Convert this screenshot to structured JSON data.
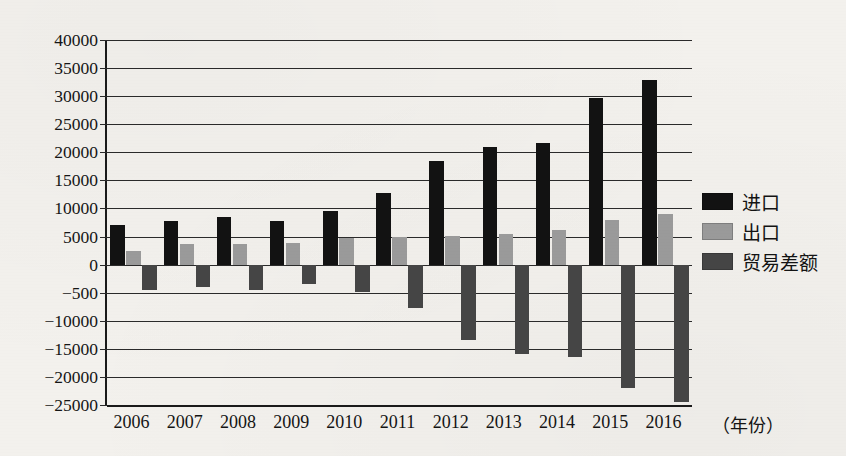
{
  "chart_data": {
    "type": "bar",
    "title": "",
    "xlabel": "（年份）",
    "ylabel": "",
    "grid": true,
    "legend_position": "right",
    "ylim": [
      -25000,
      40000
    ],
    "ytick_labels": [
      "40000",
      "35000",
      "30000",
      "25000",
      "20000",
      "15000",
      "10000",
      "5000",
      "0",
      "-500",
      "-10000",
      "-15000",
      "-20000",
      "-25000"
    ],
    "ytick_values": [
      40000,
      35000,
      30000,
      25000,
      20000,
      15000,
      10000,
      5000,
      0,
      -5000,
      -10000,
      -15000,
      -20000,
      -25000
    ],
    "categories": [
      "2006",
      "2007",
      "2008",
      "2009",
      "2010",
      "2011",
      "2012",
      "2013",
      "2014",
      "2015",
      "2016"
    ],
    "series": [
      {
        "name": "进口",
        "color": "#121212",
        "values": [
          7000,
          7700,
          8400,
          7700,
          9600,
          12800,
          18400,
          20900,
          21700,
          29700,
          32800
        ]
      },
      {
        "name": "出口",
        "color": "#9a9a9a",
        "values": [
          2500,
          3700,
          3600,
          3900,
          4800,
          4900,
          5100,
          5500,
          6200,
          8000,
          9000
        ]
      },
      {
        "name": "贸易差额",
        "color": "#454545",
        "values": [
          -4500,
          -4000,
          -4500,
          -3500,
          -4800,
          -7800,
          -13500,
          -16000,
          -16500,
          -22000,
          -24500
        ]
      }
    ]
  },
  "axis": {
    "x_title": "（年份）"
  },
  "legend": {
    "items": [
      {
        "label": "进口",
        "swatch": "legend-swatch-import"
      },
      {
        "label": "出口",
        "swatch": "legend-swatch-export"
      },
      {
        "label": "贸易差额",
        "swatch": "legend-swatch-balance"
      }
    ]
  }
}
